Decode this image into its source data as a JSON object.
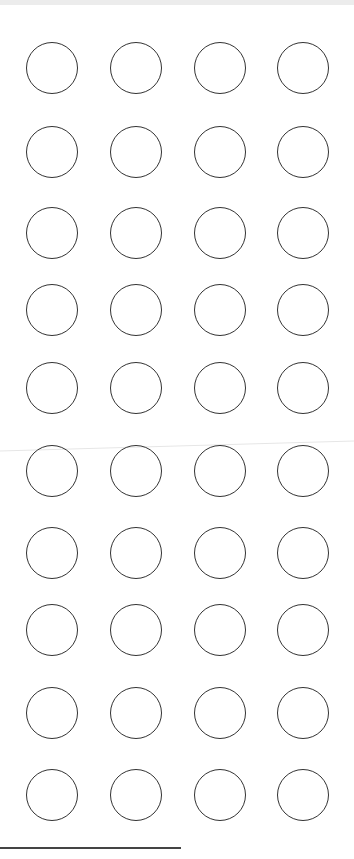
{
  "sheet": {
    "background": "#ffffff",
    "stroke_color": "#333333",
    "grid": {
      "rows": 10,
      "columns": 4,
      "column_centers_x": [
        52,
        136,
        220,
        303
      ],
      "row_centers_y": [
        68,
        152,
        233,
        310,
        388,
        471,
        553,
        630,
        713,
        795
      ],
      "circle_radius": 26
    },
    "bottom_line": {
      "x1": 0,
      "x2": 181,
      "y": 848
    }
  }
}
